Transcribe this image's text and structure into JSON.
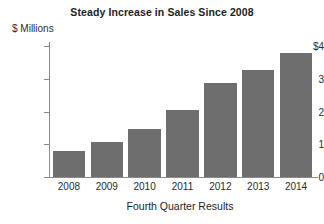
{
  "chart_data": {
    "type": "bar",
    "title": "Steady Increase in Sales Since 2008",
    "categories": [
      "2008",
      "2009",
      "2010",
      "2011",
      "2012",
      "2013",
      "2014"
    ],
    "values": [
      0.8,
      1.07,
      1.47,
      2.05,
      2.87,
      3.27,
      3.8
    ],
    "xlabel": "Fourth Quarter Results",
    "ylabel": "$ Millions",
    "ylim": [
      0,
      4.2
    ],
    "ytick_values": [
      4,
      3,
      2,
      1,
      0
    ],
    "ytick_labels": [
      "$4",
      "3",
      "2",
      "1",
      "0"
    ],
    "grid": false,
    "legend": null,
    "bar_color": "#6e6e6e",
    "axis_color": "#8a8a8a",
    "text_color": "#2b2b2b",
    "background": "#ffffff"
  }
}
